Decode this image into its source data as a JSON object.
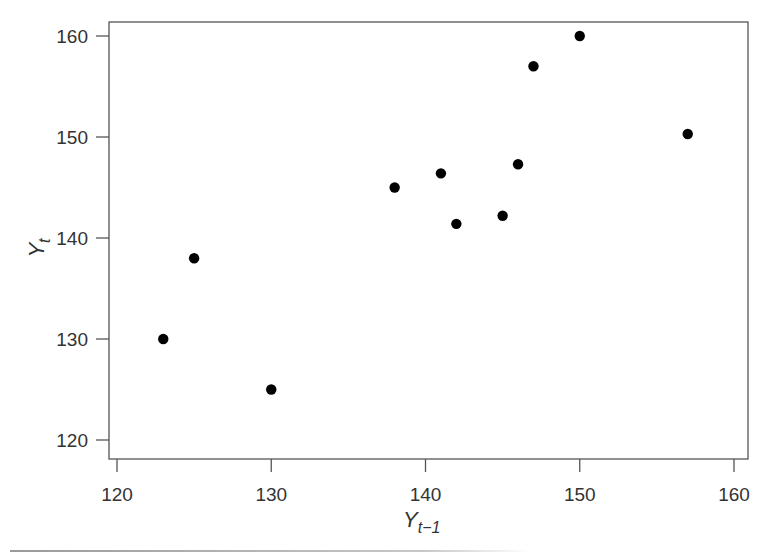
{
  "chart_data": {
    "type": "scatter",
    "title": "",
    "xlabel": "Y_{t-1}",
    "ylabel": "Y_t",
    "xlabel_main": "Y",
    "xlabel_sub": "t−1",
    "ylabel_main": "Y",
    "ylabel_sub": "t",
    "xlim": [
      119,
      161
    ],
    "ylim": [
      118.5,
      161.5
    ],
    "xticks": [
      120,
      130,
      140,
      150,
      160
    ],
    "yticks": [
      120,
      130,
      140,
      150,
      160
    ],
    "grid": false,
    "legend": null,
    "points": [
      {
        "x": 123,
        "y": 130
      },
      {
        "x": 125,
        "y": 138
      },
      {
        "x": 130,
        "y": 125
      },
      {
        "x": 138,
        "y": 145
      },
      {
        "x": 141,
        "y": 146.4
      },
      {
        "x": 142,
        "y": 141.4
      },
      {
        "x": 145,
        "y": 142.2
      },
      {
        "x": 146,
        "y": 147.3
      },
      {
        "x": 147,
        "y": 157
      },
      {
        "x": 150,
        "y": 160
      },
      {
        "x": 157,
        "y": 150.3
      }
    ],
    "marker_color": "#000000",
    "axis_color": "#555555"
  }
}
